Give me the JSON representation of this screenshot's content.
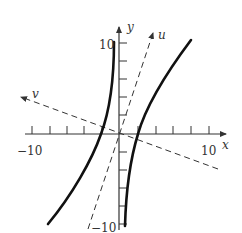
{
  "diagram": {
    "axes": {
      "x_label": "x",
      "y_label": "y",
      "x_min_label": "−10",
      "x_max_label": "10",
      "y_max_label": "10",
      "y_min_label": "−10"
    },
    "rotated_axes": {
      "u_label": "u",
      "v_label": "v"
    },
    "colors": {
      "curve": "#111111",
      "axis": "#333333",
      "dashed": "#333333",
      "background": "#ffffff"
    }
  }
}
